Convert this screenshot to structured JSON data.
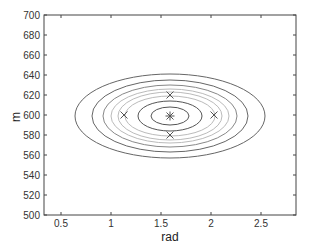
{
  "chart_data": {
    "type": "contour",
    "title": "",
    "xlabel": "rad",
    "ylabel": "m",
    "xlim": [
      0.33,
      2.85
    ],
    "ylim": [
      500,
      700
    ],
    "xticks": [
      0.5,
      1,
      1.5,
      2,
      2.5
    ],
    "xtick_labels": [
      "0.5",
      "1",
      "1.5",
      "2",
      "2.5"
    ],
    "yticks": [
      500,
      520,
      540,
      560,
      580,
      600,
      620,
      640,
      660,
      680,
      700
    ],
    "ytick_labels": [
      "500",
      "520",
      "540",
      "560",
      "580",
      "600",
      "620",
      "640",
      "660",
      "680",
      "700"
    ],
    "grid": false,
    "legend": null,
    "contours": {
      "center": {
        "rad": 1.59,
        "m": 599
      },
      "ellipses": [
        {
          "rx_rad": 0.19,
          "ry_m": 9,
          "color": "#555555"
        },
        {
          "rx_rad": 0.32,
          "ry_m": 15,
          "color": "#555555"
        },
        {
          "rx_rad": 0.45,
          "ry_m": 20,
          "color": "#bbbbbb"
        },
        {
          "rx_rad": 0.52,
          "ry_m": 24,
          "color": "#bbbbbb"
        },
        {
          "rx_rad": 0.59,
          "ry_m": 27,
          "color": "#bbbbbb"
        },
        {
          "rx_rad": 0.67,
          "ry_m": 31,
          "color": "#888888"
        },
        {
          "rx_rad": 0.78,
          "ry_m": 36,
          "color": "#666666"
        },
        {
          "rx_rad": 0.95,
          "ry_m": 42,
          "color": "#666666"
        }
      ]
    },
    "markers": [
      {
        "rad": 1.59,
        "m": 599,
        "symbol": "asterisk"
      },
      {
        "rad": 1.59,
        "m": 620,
        "symbol": "x"
      },
      {
        "rad": 1.59,
        "m": 580,
        "symbol": "x"
      },
      {
        "rad": 1.13,
        "m": 600,
        "symbol": "x"
      },
      {
        "rad": 2.03,
        "m": 600,
        "symbol": "x"
      }
    ]
  },
  "colors": {
    "axis": "#444444",
    "marker": "#555555"
  }
}
